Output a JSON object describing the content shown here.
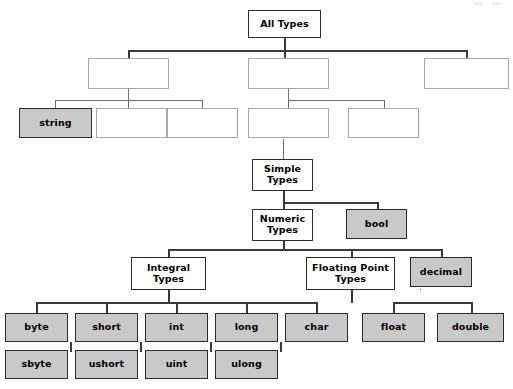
{
  "diagram": {
    "title": "All Types",
    "kind": "tree",
    "colors": {
      "filled_node_bg": "#c9c9c9",
      "solid_node_bg": "#ffffff",
      "node_border": "#2b2b2b",
      "blank_node_border": "#a8a8a8",
      "connector": "#6e6e6e",
      "page_bg": "#ffffff"
    },
    "levels": [
      {
        "level": 1,
        "nodes": [
          {
            "id": "all-types",
            "label": "All Types",
            "style": "solid",
            "x": 248,
            "y": 10,
            "w": 73,
            "h": 28
          }
        ]
      },
      {
        "level": 2,
        "nodes": [
          {
            "id": "l2-left",
            "label": "",
            "style": "blank",
            "x": 88,
            "y": 58,
            "w": 81,
            "h": 31
          },
          {
            "id": "l2-mid",
            "label": "",
            "style": "blank",
            "x": 248,
            "y": 58,
            "w": 81,
            "h": 31
          },
          {
            "id": "l2-right",
            "label": "",
            "style": "blank",
            "x": 424,
            "y": 58,
            "w": 85,
            "h": 31
          }
        ]
      },
      {
        "level": 3,
        "nodes": [
          {
            "id": "string",
            "label": "string",
            "style": "filled",
            "x": 19,
            "y": 108,
            "w": 73,
            "h": 30
          },
          {
            "id": "l3-a",
            "label": "",
            "style": "blank",
            "x": 96,
            "y": 108,
            "w": 71,
            "h": 30
          },
          {
            "id": "l3-b",
            "label": "",
            "style": "blank",
            "x": 167,
            "y": 108,
            "w": 71,
            "h": 30
          },
          {
            "id": "l3-c",
            "label": "",
            "style": "blank",
            "x": 248,
            "y": 108,
            "w": 81,
            "h": 30
          },
          {
            "id": "l3-d",
            "label": "",
            "style": "blank",
            "x": 348,
            "y": 108,
            "w": 71,
            "h": 30
          }
        ]
      },
      {
        "level": 4,
        "nodes": [
          {
            "id": "simple-types",
            "label": "Simple\nTypes",
            "style": "solid",
            "x": 252,
            "y": 159,
            "w": 61,
            "h": 32
          }
        ]
      },
      {
        "level": 5,
        "nodes": [
          {
            "id": "numeric-types",
            "label": "Numeric\nTypes",
            "style": "solid",
            "x": 252,
            "y": 209,
            "w": 61,
            "h": 32
          },
          {
            "id": "bool",
            "label": "bool",
            "style": "filled",
            "x": 346,
            "y": 209,
            "w": 61,
            "h": 30
          }
        ]
      },
      {
        "level": 6,
        "nodes": [
          {
            "id": "integral-types",
            "label": "Integral\nTypes",
            "style": "solid",
            "x": 131,
            "y": 257,
            "w": 75,
            "h": 33
          },
          {
            "id": "floating-point-types",
            "label": "Floating Point\nTypes",
            "style": "solid",
            "x": 306,
            "y": 257,
            "w": 89,
            "h": 33
          },
          {
            "id": "decimal",
            "label": "decimal",
            "style": "filled",
            "x": 410,
            "y": 257,
            "w": 62,
            "h": 30
          }
        ]
      },
      {
        "level": 7,
        "nodes": [
          {
            "id": "byte",
            "label": "byte",
            "style": "filled",
            "x": 5,
            "y": 313,
            "w": 63,
            "h": 29
          },
          {
            "id": "short",
            "label": "short",
            "style": "filled",
            "x": 75,
            "y": 313,
            "w": 63,
            "h": 29
          },
          {
            "id": "int",
            "label": "int",
            "style": "filled",
            "x": 145,
            "y": 313,
            "w": 63,
            "h": 29
          },
          {
            "id": "long",
            "label": "long",
            "style": "filled",
            "x": 215,
            "y": 313,
            "w": 63,
            "h": 29
          },
          {
            "id": "char",
            "label": "char",
            "style": "filled",
            "x": 285,
            "y": 313,
            "w": 63,
            "h": 29
          },
          {
            "id": "float",
            "label": "float",
            "style": "filled",
            "x": 362,
            "y": 313,
            "w": 63,
            "h": 29
          },
          {
            "id": "double",
            "label": "double",
            "style": "filled",
            "x": 437,
            "y": 313,
            "w": 67,
            "h": 29
          }
        ]
      },
      {
        "level": 8,
        "nodes": [
          {
            "id": "sbyte",
            "label": "sbyte",
            "style": "filled",
            "x": 5,
            "y": 350,
            "w": 63,
            "h": 29
          },
          {
            "id": "ushort",
            "label": "ushort",
            "style": "filled",
            "x": 75,
            "y": 350,
            "w": 63,
            "h": 29
          },
          {
            "id": "uint",
            "label": "uint",
            "style": "filled",
            "x": 145,
            "y": 350,
            "w": 63,
            "h": 29
          },
          {
            "id": "ulong",
            "label": "ulong",
            "style": "filled",
            "x": 215,
            "y": 350,
            "w": 63,
            "h": 29
          }
        ]
      }
    ],
    "connectors": [
      {
        "kind": "v",
        "x": 284,
        "y": 38,
        "len": 13,
        "weight": "dark"
      },
      {
        "kind": "h",
        "x": 128,
        "y": 50,
        "len": 338,
        "weight": "dark"
      },
      {
        "kind": "v",
        "x": 128,
        "y": 50,
        "len": 9,
        "weight": "dark"
      },
      {
        "kind": "v",
        "x": 284,
        "y": 50,
        "len": 9,
        "weight": "dark"
      },
      {
        "kind": "v",
        "x": 466,
        "y": 50,
        "len": 9,
        "weight": "dark"
      },
      {
        "kind": "v",
        "x": 128,
        "y": 89,
        "len": 11,
        "weight": "light"
      },
      {
        "kind": "h",
        "x": 55,
        "y": 100,
        "len": 148,
        "weight": "light"
      },
      {
        "kind": "v",
        "x": 55,
        "y": 100,
        "len": 9,
        "weight": "light"
      },
      {
        "kind": "v",
        "x": 128,
        "y": 100,
        "len": 9,
        "weight": "light"
      },
      {
        "kind": "v",
        "x": 202,
        "y": 100,
        "len": 9,
        "weight": "light"
      },
      {
        "kind": "v",
        "x": 288,
        "y": 89,
        "len": 11,
        "weight": "light"
      },
      {
        "kind": "h",
        "x": 288,
        "y": 100,
        "len": 96,
        "weight": "light"
      },
      {
        "kind": "v",
        "x": 288,
        "y": 100,
        "len": 9,
        "weight": "light"
      },
      {
        "kind": "v",
        "x": 384,
        "y": 100,
        "len": 9,
        "weight": "light"
      },
      {
        "kind": "v",
        "x": 283,
        "y": 139,
        "len": 21,
        "weight": "light"
      },
      {
        "kind": "v",
        "x": 283,
        "y": 191,
        "len": 12,
        "weight": "dark"
      },
      {
        "kind": "h",
        "x": 283,
        "y": 202,
        "len": 94,
        "weight": "dark"
      },
      {
        "kind": "v",
        "x": 283,
        "y": 202,
        "len": 8,
        "weight": "dark"
      },
      {
        "kind": "v",
        "x": 377,
        "y": 202,
        "len": 8,
        "weight": "dark"
      },
      {
        "kind": "v",
        "x": 283,
        "y": 241,
        "len": 9,
        "weight": "dark"
      },
      {
        "kind": "h",
        "x": 168,
        "y": 249,
        "len": 273,
        "weight": "dark"
      },
      {
        "kind": "v",
        "x": 168,
        "y": 249,
        "len": 9,
        "weight": "dark"
      },
      {
        "kind": "v",
        "x": 351,
        "y": 249,
        "len": 9,
        "weight": "dark"
      },
      {
        "kind": "v",
        "x": 441,
        "y": 249,
        "len": 9,
        "weight": "dark"
      },
      {
        "kind": "v",
        "x": 168,
        "y": 290,
        "len": 13,
        "weight": "dark"
      },
      {
        "kind": "h",
        "x": 36,
        "y": 302,
        "len": 281,
        "weight": "dark"
      },
      {
        "kind": "v",
        "x": 36,
        "y": 302,
        "len": 12,
        "weight": "dark"
      },
      {
        "kind": "v",
        "x": 106,
        "y": 302,
        "len": 12,
        "weight": "dark"
      },
      {
        "kind": "v",
        "x": 176,
        "y": 302,
        "len": 12,
        "weight": "dark"
      },
      {
        "kind": "v",
        "x": 246,
        "y": 302,
        "len": 12,
        "weight": "dark"
      },
      {
        "kind": "v",
        "x": 316,
        "y": 302,
        "len": 12,
        "weight": "dark"
      },
      {
        "kind": "v",
        "x": 351,
        "y": 290,
        "len": 13,
        "weight": "dark"
      },
      {
        "kind": "h",
        "x": 393,
        "y": 302,
        "len": 78,
        "weight": "dark"
      },
      {
        "kind": "v",
        "x": 393,
        "y": 302,
        "len": 12,
        "weight": "dark"
      },
      {
        "kind": "v",
        "x": 471,
        "y": 302,
        "len": 12,
        "weight": "dark"
      },
      {
        "kind": "v",
        "x": 351,
        "y": 302,
        "len": 1,
        "weight": "dark"
      },
      {
        "kind": "v",
        "x": 70,
        "y": 342,
        "len": 10,
        "weight": "dark"
      },
      {
        "kind": "v",
        "x": 140,
        "y": 342,
        "len": 10,
        "weight": "dark"
      },
      {
        "kind": "v",
        "x": 210,
        "y": 342,
        "len": 10,
        "weight": "dark"
      },
      {
        "kind": "v",
        "x": 280,
        "y": 342,
        "len": 10,
        "weight": "dark"
      },
      {
        "kind": "h",
        "x": 420,
        "y": 289,
        "len": 1,
        "weight": "light"
      }
    ],
    "scan_artifacts": [
      {
        "x": 474,
        "y": 2,
        "w": 9,
        "h": 3
      },
      {
        "x": 492,
        "y": 2,
        "w": 9,
        "h": 3
      }
    ]
  }
}
